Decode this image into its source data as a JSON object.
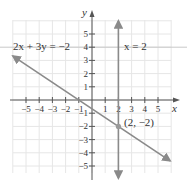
{
  "chart_data": {
    "type": "line",
    "title": "",
    "xlabel": "x",
    "ylabel": "y",
    "xlim": [
      -6,
      6
    ],
    "ylim": [
      -6,
      6
    ],
    "grid": true,
    "x_ticks": [
      -5,
      -4,
      -3,
      -2,
      -1,
      1,
      2,
      3,
      4,
      5
    ],
    "y_ticks": [
      -5,
      -4,
      -3,
      -2,
      -1,
      1,
      2,
      3,
      4,
      5
    ],
    "x_tick_labels": [
      "−5",
      "−4",
      "−3",
      "−2",
      "−1",
      "1",
      "2",
      "3",
      "4",
      "5"
    ],
    "y_tick_labels": [
      "−5",
      "−4",
      "−3",
      "−2",
      "−1",
      "1",
      "2",
      "3",
      "4",
      "5"
    ],
    "series": [
      {
        "name": "2x + 3y = −2",
        "equation": "2x + 3y = -2",
        "kind": "line",
        "x": [
          -6,
          6
        ],
        "y": [
          3.33,
          -4.67
        ],
        "color": "#8a8a8a"
      },
      {
        "name": "x = 2",
        "equation": "x = 2",
        "kind": "vertical-line",
        "x": [
          2,
          2
        ],
        "y": [
          -6,
          6
        ],
        "color": "#8a8a8a"
      }
    ],
    "annotations": [
      {
        "text": "2x + 3y = −2",
        "near": [
          -4.5,
          4
        ]
      },
      {
        "text": "x = 2",
        "near": [
          2.3,
          4
        ]
      },
      {
        "text": "(2, −2)",
        "point": [
          2,
          -2
        ]
      }
    ],
    "intersection": {
      "x": 2,
      "y": -2,
      "label": "(2, −2)"
    }
  },
  "labels": {
    "eq1": "2x + 3y = −2",
    "eq2": "x = 2",
    "point": "(2, −2)",
    "x_axis": "x",
    "y_axis": "y"
  },
  "colors": {
    "grid": "#e6e6e6",
    "axis": "#555555",
    "line": "#8a8a8a",
    "highlight_line": "#c8c8c8"
  }
}
